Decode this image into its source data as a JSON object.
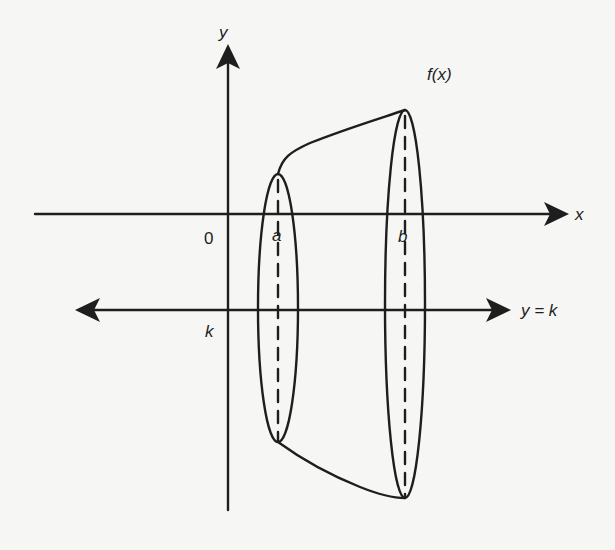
{
  "diagram": {
    "colors": {
      "background": "#f6f6f5",
      "ink": "#1e1e1e"
    },
    "labels": {
      "y_axis": "y",
      "x_axis": "x",
      "function": "f(x)",
      "origin": "0",
      "a": "a",
      "b": "b",
      "k": "k",
      "axis_of_rotation": "y = k"
    },
    "elements": [
      {
        "type": "axis",
        "name": "x-axis",
        "direction": "horizontal",
        "arrow": "right"
      },
      {
        "type": "axis",
        "name": "y-axis",
        "direction": "vertical",
        "arrow": "up"
      },
      {
        "type": "line",
        "name": "rotation-line",
        "equation": "y = k",
        "arrows": "both"
      },
      {
        "type": "ellipse",
        "name": "cross-section-at-a",
        "at": "x = a",
        "center_axis": "dashed"
      },
      {
        "type": "ellipse",
        "name": "cross-section-at-b",
        "at": "x = b",
        "center_axis": "dashed"
      },
      {
        "type": "curve",
        "name": "upper-curve",
        "label": "f(x)",
        "from": "a",
        "to": "b"
      },
      {
        "type": "curve",
        "name": "lower-curve-reflection",
        "from": "a",
        "to": "b"
      }
    ]
  }
}
